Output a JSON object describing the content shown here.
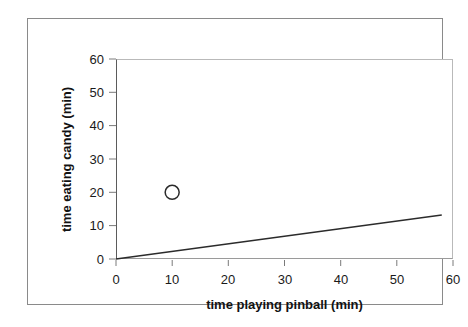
{
  "chart_data": {
    "type": "scatter",
    "title": "",
    "xlabel": "time playing pinball (min)",
    "ylabel": "time eating candy (min)",
    "xlim": [
      0,
      60
    ],
    "ylim": [
      0,
      60
    ],
    "xticks": [
      0,
      10,
      20,
      30,
      40,
      50,
      60
    ],
    "yticks": [
      0,
      10,
      20,
      30,
      40,
      50,
      60
    ],
    "xtick_labels": [
      "0",
      "10",
      "20",
      "30",
      "40",
      "50",
      "60"
    ],
    "ytick_labels": [
      "0",
      "10",
      "20",
      "30",
      "40",
      "50",
      "60"
    ],
    "grid": false,
    "legend": false,
    "series": [
      {
        "name": "data point",
        "marker": "open-circle",
        "points": [
          {
            "x": 10,
            "y": 20
          }
        ]
      },
      {
        "name": "trend line",
        "type": "line",
        "points": [
          {
            "x": 0,
            "y": 0
          },
          {
            "x": 58,
            "y": 13.2
          }
        ]
      }
    ],
    "colors": {
      "marker_stroke": "#2b2b2b",
      "marker_fill": "none",
      "line": "#2b2b2b",
      "axis": "#5b5b5b",
      "plot_border": "#b9b9b9",
      "frame": "#8a8a8a",
      "text": "#1a1a1a",
      "background": "#ffffff"
    }
  }
}
